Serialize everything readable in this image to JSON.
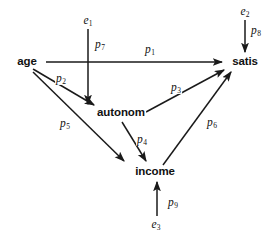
{
  "diagram": {
    "type": "path-diagram",
    "title": "",
    "canvas": {
      "width": 271,
      "height": 241
    },
    "stroke_color": "#1a1a1a",
    "background_color": "#ffffff",
    "nodes": [
      {
        "id": "age",
        "label": "age",
        "x": 27,
        "y": 62
      },
      {
        "id": "autonom",
        "label": "autonom",
        "x": 121,
        "y": 113
      },
      {
        "id": "income",
        "label": "income",
        "x": 155,
        "y": 172
      },
      {
        "id": "satis",
        "label": "satis",
        "x": 245,
        "y": 62
      }
    ],
    "errors": [
      {
        "id": "e1",
        "label": "e",
        "subscript": "1",
        "x": 88,
        "y": 21
      },
      {
        "id": "e2",
        "label": "e",
        "subscript": "2",
        "x": 245,
        "y": 12
      },
      {
        "id": "e3",
        "label": "e",
        "subscript": "3",
        "x": 156,
        "y": 225
      }
    ],
    "paths": [
      {
        "id": "p1",
        "label": "p",
        "subscript": "1",
        "from": "age",
        "to": "satis",
        "label_x": 150,
        "label_y": 50
      },
      {
        "id": "p2",
        "label": "p",
        "subscript": "2",
        "from": "age",
        "to": "autonom",
        "label_x": 61,
        "label_y": 79
      },
      {
        "id": "p3",
        "label": "p",
        "subscript": "3",
        "from": "autonom",
        "to": "satis",
        "label_x": 176,
        "label_y": 88
      },
      {
        "id": "p4",
        "label": "p",
        "subscript": "4",
        "from": "autonom",
        "to": "income",
        "label_x": 142,
        "label_y": 140
      },
      {
        "id": "p5",
        "label": "p",
        "subscript": "5",
        "from": "age",
        "to": "income",
        "label_x": 65,
        "label_y": 124
      },
      {
        "id": "p6",
        "label": "p",
        "subscript": "6",
        "from": "income",
        "to": "satis",
        "label_x": 212,
        "label_y": 123
      },
      {
        "id": "p7",
        "label": "p",
        "subscript": "7",
        "from": "e1",
        "to": "autonom",
        "label_x": 100,
        "label_y": 45
      },
      {
        "id": "p8",
        "label": "p",
        "subscript": "8",
        "from": "e2",
        "to": "satis",
        "label_x": 256,
        "label_y": 31
      },
      {
        "id": "p9",
        "label": "p",
        "subscript": "9",
        "from": "e3",
        "to": "income",
        "label_x": 173,
        "label_y": 203
      }
    ]
  }
}
